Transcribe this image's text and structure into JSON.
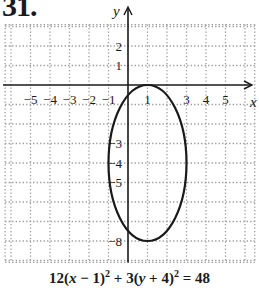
{
  "problem": {
    "number": "31."
  },
  "equation": {
    "text": "12(x − 1)^2 + 3(y + 4)^2 = 48",
    "parts": {
      "a": "12(",
      "x": "x",
      "b": " − 1)",
      "exp1": "2",
      "c": " + 3(",
      "y": "y",
      "d": " + 4)",
      "exp2": "2",
      "e": " = 48"
    }
  },
  "colors": {
    "axis": "#1a1a1a",
    "grid": "#9a9a9a",
    "curve": "#1a1a1a",
    "background": "#ffffff"
  },
  "chart_data": {
    "type": "line",
    "title": "31.",
    "subtitle": "12(x − 1)^2 + 3(y + 4)^2 = 48",
    "xlabel": "x",
    "ylabel": "y",
    "xlim": [
      -6.3,
      6.5
    ],
    "ylim": [
      -9.1,
      3.1
    ],
    "grid": true,
    "grid_style": "dotted",
    "x_tick_labels": [
      "−5",
      "−4",
      "−3",
      "−2",
      "−1",
      "1",
      "3",
      "4",
      "5"
    ],
    "x_tick_values": [
      -5,
      -4,
      -3,
      -2,
      -1,
      1,
      3,
      4,
      5
    ],
    "y_tick_labels": [
      "2",
      "1",
      "−3",
      "−4",
      "−5",
      "−8"
    ],
    "y_tick_values": [
      2,
      1,
      -3,
      -4,
      -5,
      -8
    ],
    "series": [
      {
        "name": "ellipse",
        "shape": "ellipse",
        "center": [
          1,
          -4
        ],
        "semi_axis_x": 2,
        "semi_axis_y": 4,
        "vertices": [
          [
            1,
            0
          ],
          [
            1,
            -8
          ]
        ],
        "co_vertices": [
          [
            -1,
            -4
          ],
          [
            3,
            -4
          ]
        ]
      }
    ],
    "legend": null
  }
}
